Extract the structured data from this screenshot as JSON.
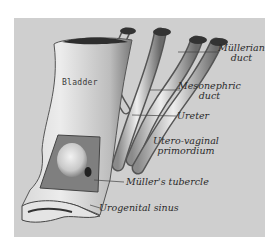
{
  "figure": {
    "background_color": "#cfcfcf",
    "labels": {
      "bladder": "Bladder",
      "mullerian_duct_line1": "Müllerian",
      "mullerian_duct_line2": "duct",
      "mesonephric_duct_line1": "Mesonephric",
      "mesonephric_duct_line2": "duct",
      "ureter": "Ureter",
      "utero_vaginal_line1": "Utero-vaginal",
      "utero_vaginal_line2": "primordium",
      "mullers_tubercle": "Müller's tubercle",
      "urogenital_sinus": "Urogenital sinus"
    }
  }
}
